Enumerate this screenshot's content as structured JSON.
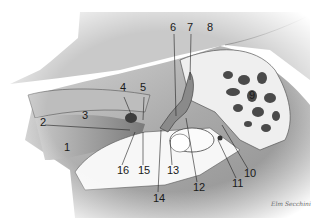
{
  "figure": {
    "signature": "Elm Secchini",
    "labels": [
      {
        "n": "1",
        "x": 64,
        "y": 147
      },
      {
        "n": "2",
        "x": 40,
        "y": 122
      },
      {
        "n": "3",
        "x": 84,
        "y": 113
      },
      {
        "n": "4",
        "x": 120,
        "y": 86
      },
      {
        "n": "5",
        "x": 140,
        "y": 86
      },
      {
        "n": "6",
        "x": 170,
        "y": 23
      },
      {
        "n": "7",
        "x": 187,
        "y": 23
      },
      {
        "n": "8",
        "x": 208,
        "y": 23
      },
      {
        "n": "9",
        "x": 249,
        "y": 93
      },
      {
        "n": "10",
        "x": 244,
        "y": 171
      },
      {
        "n": "11",
        "x": 232,
        "y": 180
      },
      {
        "n": "12",
        "x": 193,
        "y": 184
      },
      {
        "n": "13",
        "x": 168,
        "y": 167
      },
      {
        "n": "14",
        "x": 154,
        "y": 194
      },
      {
        "n": "15",
        "x": 139,
        "y": 167
      },
      {
        "n": "16",
        "x": 118,
        "y": 167
      }
    ]
  }
}
